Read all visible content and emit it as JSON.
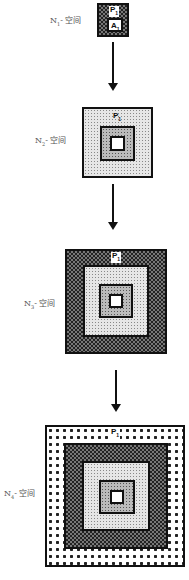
{
  "stages": [
    {
      "label_main": "N",
      "label_sub": "1",
      "label_suffix": "- 空间",
      "tag_main": "P",
      "tag_sub": "1",
      "inner_tag_main": "A",
      "inner_tag_sub": "1"
    },
    {
      "label_main": "N",
      "label_sub": "2",
      "label_suffix": "- 空间",
      "tag_main": "P",
      "tag_sub": "1"
    },
    {
      "label_main": "N",
      "label_sub": "3",
      "label_suffix": "- 空间",
      "tag_main": "P",
      "tag_sub": "1"
    },
    {
      "label_main": "N",
      "label_sub": "4",
      "label_suffix": "- 空间",
      "tag_main": "P",
      "tag_sub": "1"
    }
  ],
  "colors": {
    "line": "#111111",
    "label": "#555555"
  }
}
